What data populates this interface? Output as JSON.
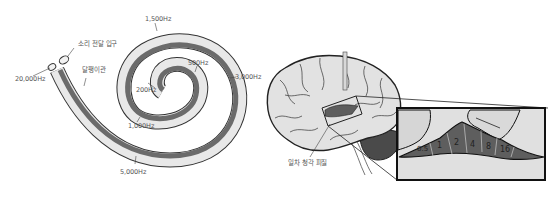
{
  "cochlea": {
    "labels": {
      "entrance": "소리 전달 입구",
      "duct": "달팽이관",
      "f20000": "20,000Hz",
      "f1500": "1,500Hz",
      "f500": "500Hz",
      "f200": "200Hz",
      "f1000": "1,000Hz",
      "f3000": "3,000Hz",
      "f5000": "5,000Hz"
    }
  },
  "brain": {
    "labels": {
      "auditory_cortex": "일차 청각 피질"
    },
    "inset": {
      "bands": [
        "0.5",
        "1",
        "2",
        "4",
        "8",
        "16"
      ]
    }
  },
  "colors": {
    "tube_light": "#e6e6e6",
    "tube_dark": "#6b6b6b",
    "outline": "#333333",
    "brain_fill": "#e2e2e2",
    "cortex_fill": "#5e5e5e",
    "cerebellum_fill": "#4a4a4a"
  }
}
